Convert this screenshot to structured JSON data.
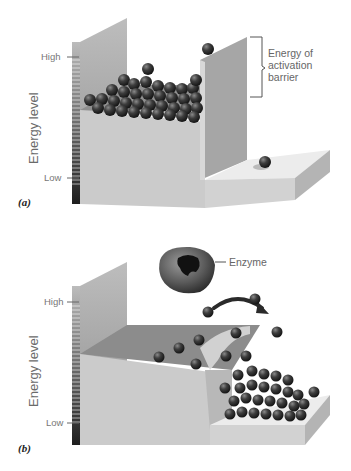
{
  "panels": [
    {
      "id": "a",
      "label": "(a)",
      "axis_title": "Energy level",
      "tick_high": "High",
      "tick_low": "Low",
      "callout": [
        "Energy of",
        "activation",
        "barrier"
      ]
    },
    {
      "id": "b",
      "label": "(b)",
      "axis_title": "Energy level",
      "tick_high": "High",
      "tick_low": "Low",
      "callout": [
        "Enzyme"
      ]
    }
  ],
  "colors": {
    "ball": "#3a3a3a",
    "wall_light": "#cfcfcf",
    "wall_dark": "#a9a9a9",
    "floor": "#e6e6e6",
    "scale_dark": "#2b2b2b",
    "arrow": "#2a2a2a"
  }
}
